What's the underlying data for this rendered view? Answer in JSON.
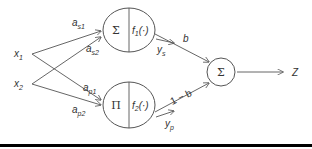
{
  "diagram": {
    "inputs": [
      {
        "id": "x1",
        "label": "x",
        "sub": "1"
      },
      {
        "id": "x2",
        "label": "x",
        "sub": "2"
      }
    ],
    "weights": {
      "as1": {
        "label": "a",
        "sub": "s1"
      },
      "as2": {
        "label": "a",
        "sub": "s2"
      },
      "ap1": {
        "label": "a",
        "sub": "p1"
      },
      "ap2": {
        "label": "a",
        "sub": "p2"
      }
    },
    "nodes": {
      "sum_node": {
        "op": "Σ",
        "func": "f",
        "func_sub": "1",
        "func_arg": "(·)"
      },
      "prod_node": {
        "op": "Π",
        "func": "f",
        "func_sub": "2",
        "func_arg": "(·)"
      },
      "output_sum": {
        "op": "Σ"
      }
    },
    "outputs": {
      "ys": {
        "label": "y",
        "sub": "s"
      },
      "yp": {
        "label": "y",
        "sub": "p"
      },
      "b": "b",
      "one_minus_b": "1 − b",
      "z": "Z"
    },
    "colors": {
      "line": "#555555",
      "text": "#333333",
      "bottom_rule": "#000000"
    }
  }
}
